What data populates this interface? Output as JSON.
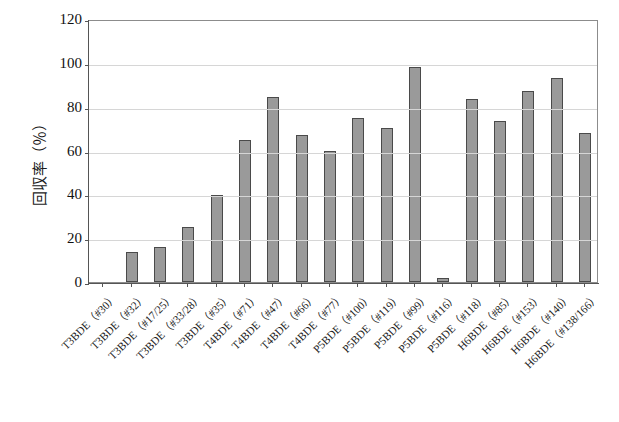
{
  "chart_data": {
    "type": "bar",
    "title": "",
    "xlabel": "",
    "ylabel": "回収率（％）",
    "ylim": [
      0,
      120
    ],
    "yticks": [
      0,
      20,
      40,
      60,
      80,
      100,
      120
    ],
    "grid": true,
    "legend": "none",
    "categories": [
      "T3BDE（#30）",
      "T3BDE（#32）",
      "T3BDE（#17/25）",
      "T3BDE（#33/28）",
      "T3BDE（#35）",
      "T4BDE（#71）",
      "T4BDE（#47）",
      "T4BDE（#66）",
      "T4BDE（#77）",
      "P5BDE（#100）",
      "P5BDE（#119）",
      "P5BDE（#99）",
      "P5BDE（#116）",
      "P5BDE（#118）",
      "H6BDE（#85）",
      "H6BDE（#153）",
      "H6BDE（#140）",
      "H6BDE（#138/166）"
    ],
    "values": [
      0,
      13.5,
      16,
      25,
      39.5,
      65,
      84.5,
      67,
      60,
      75,
      70.5,
      98,
      2,
      83.5,
      73.5,
      87,
      93,
      68
    ],
    "bar_color": "#9a9a9a",
    "bar_edge_color": "#4a4a4a",
    "grid_color": "#d6d6d6",
    "axis_color": "#555555",
    "background": "#ffffff"
  }
}
